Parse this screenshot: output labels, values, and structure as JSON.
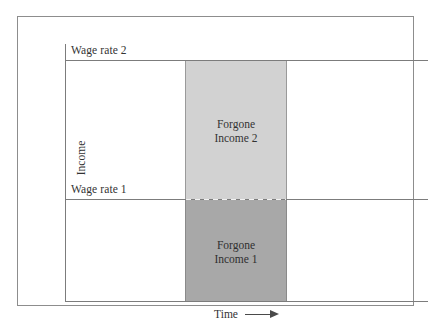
{
  "figure": {
    "type": "economics-diagram",
    "axes": {
      "y_title": "Income",
      "x_title": "Time",
      "x_arrow_icon": "right-arrow-icon"
    },
    "reference_lines": [
      {
        "id": "wage-rate-2",
        "label": "Wage rate 2",
        "style": "solid"
      },
      {
        "id": "wage-rate-1",
        "label": "Wage rate 1",
        "style": "solid-with-dashed-overlay"
      }
    ],
    "regions": [
      {
        "id": "forgone-income-2",
        "label_line_1": "Forgone",
        "label_line_2": "Income 2",
        "color": "#d2d2d2"
      },
      {
        "id": "forgone-income-1",
        "label_line_1": "Forgone",
        "label_line_2": "Income 1",
        "color": "#a8a8a8"
      }
    ],
    "colors": {
      "axis": "#7c7c7c",
      "border": "#8d8d8d",
      "band_upper": "#d2d2d2",
      "band_lower": "#a8a8a8",
      "text": "#333333",
      "background": "#ffffff"
    }
  }
}
